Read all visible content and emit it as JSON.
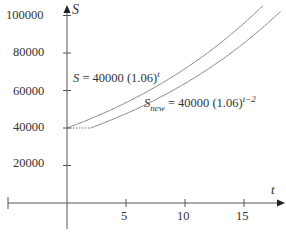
{
  "chart_data": {
    "type": "line",
    "title": "",
    "xlabel": "t",
    "ylabel": "S",
    "xlim": [
      -5,
      17.5
    ],
    "ylim": [
      -10000,
      105000
    ],
    "x_ticks": [
      5,
      10,
      15
    ],
    "y_ticks": [
      20000,
      40000,
      60000,
      80000,
      100000
    ],
    "x_tick_labels": [
      "5",
      "10",
      "15"
    ],
    "y_tick_labels": [
      "20000",
      "40000",
      "60000",
      "80000",
      "100000"
    ],
    "grid": false,
    "series": [
      {
        "name": "S = 40000 (1.06)^t",
        "formula": "40000*1.06^t",
        "x": [
          0,
          2,
          4,
          6,
          8,
          10,
          12,
          14,
          16
        ],
        "values": [
          40000,
          44944,
          50499,
          56741,
          63754,
          71634,
          80488,
          90436,
          101614
        ],
        "style": "solid"
      },
      {
        "name": "S_new = 40000 (1.06)^(t-2)",
        "formula": "40000*1.06^(t-2)",
        "x": [
          2,
          4,
          6,
          8,
          10,
          12,
          14,
          16,
          17.5
        ],
        "values": [
          40000,
          44944,
          50499,
          56741,
          63754,
          71634,
          80488,
          90436,
          96000
        ],
        "style": "solid",
        "flat_segment": {
          "x": [
            0,
            2
          ],
          "value": 40000,
          "style": "dotted"
        }
      }
    ],
    "annotations": [
      "S = 40000 (1.06)^t",
      "S_new = 40000 (1.06)^(t-2)"
    ]
  },
  "labels": {
    "y_axis": "S",
    "x_axis": "t",
    "eq1_lhs": "S = 40000 (1.06)",
    "eq1_exp": "t",
    "eq2_S": "S",
    "eq2_sub": "new",
    "eq2_rhs": " = 40000 (1.06)",
    "eq2_exp": "t−2",
    "yticks": [
      "100000",
      "80000",
      "60000",
      "40000",
      "20000"
    ],
    "xticks": [
      "5",
      "10",
      "15"
    ]
  }
}
